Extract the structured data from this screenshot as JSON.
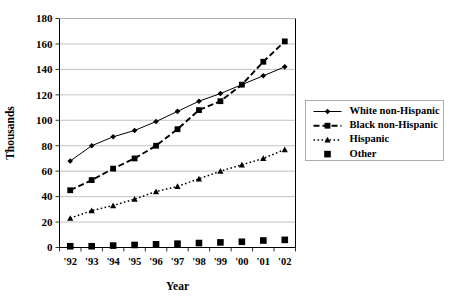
{
  "chart_data": {
    "type": "line",
    "title": "",
    "xlabel": "Year",
    "ylabel": "Thousands",
    "categories": [
      "'92",
      "'93",
      "'94",
      "'95",
      "'96",
      "'97",
      "'98",
      "'99",
      "'00",
      "'01",
      "'02"
    ],
    "ylim": [
      0,
      180
    ],
    "ytick_step": 20,
    "yticks": [
      "0",
      "20",
      "40",
      "60",
      "80",
      "100",
      "120",
      "140",
      "160",
      "180"
    ],
    "grid": "horizontal",
    "legend_position": "right",
    "series": [
      {
        "name": "White non-Hispanic",
        "marker": "diamond",
        "line_style": "solid",
        "color": "#000000",
        "values": [
          68,
          80,
          87,
          92,
          99,
          107,
          115,
          121,
          128,
          135,
          142
        ]
      },
      {
        "name": "Black non-Hispanic",
        "marker": "square",
        "line_style": "dashed",
        "color": "#000000",
        "values": [
          45,
          53,
          62,
          70,
          80,
          93,
          108,
          115,
          128,
          146,
          162
        ]
      },
      {
        "name": "Hispanic",
        "marker": "triangle",
        "line_style": "dotted",
        "color": "#000000",
        "values": [
          23,
          29,
          33,
          38,
          44,
          48,
          54,
          60,
          65,
          70,
          77
        ]
      },
      {
        "name": "Other",
        "marker": "square-large",
        "line_style": "none",
        "color": "#000000",
        "values": [
          1,
          1,
          1.5,
          2,
          2.5,
          3,
          3.5,
          4,
          4.5,
          5.5,
          6
        ]
      }
    ]
  },
  "legend": {
    "items": [
      {
        "label": "White non-Hispanic"
      },
      {
        "label": "Black non-Hispanic"
      },
      {
        "label": "Hispanic"
      },
      {
        "label": "Other"
      }
    ]
  }
}
